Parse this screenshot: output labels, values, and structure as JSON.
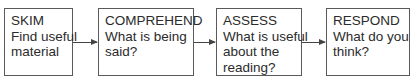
{
  "diagram": {
    "type": "flowchart",
    "direction": "left-to-right",
    "steps": [
      {
        "title": "SKIM",
        "lines": [
          "Find useful",
          "material"
        ]
      },
      {
        "title": "COMPREHEND",
        "lines": [
          "What is being",
          "said?"
        ]
      },
      {
        "title": "ASSESS",
        "lines": [
          "What is useful",
          "about the",
          "reading?"
        ]
      },
      {
        "title": "RESPOND",
        "lines": [
          "What do you",
          "think?"
        ]
      }
    ],
    "connectors": [
      {
        "from": "SKIM",
        "to": "COMPREHEND"
      },
      {
        "from": "COMPREHEND",
        "to": "ASSESS"
      },
      {
        "from": "ASSESS",
        "to": "RESPOND"
      }
    ]
  }
}
